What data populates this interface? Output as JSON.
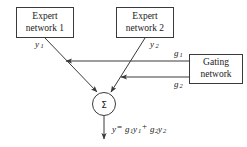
{
  "diagram": {
    "background_color": "#ffffff",
    "stroke_color": "#3a3a3a",
    "text_color": "#1a1a1a",
    "nodes": {
      "expert1": {
        "line1": "Expert",
        "line2": "network 1",
        "output_label": "y",
        "output_sub": "1"
      },
      "expert2": {
        "line1": "Expert",
        "line2": "network 2",
        "output_label": "y",
        "output_sub": "2"
      },
      "gating": {
        "line1": "Gating",
        "line2": "network",
        "output1_label": "g",
        "output1_sub": "1",
        "output2_label": "g",
        "output2_sub": "2"
      },
      "summation": {
        "symbol": "Σ"
      }
    },
    "output": {
      "var": "y",
      "equals": "=",
      "term1_coef": "g",
      "term1_coef_sub": "1",
      "term1_var": "y",
      "term1_var_sub": "1",
      "plus": "+",
      "term2_coef": "g",
      "term2_coef_sub": "2",
      "term2_var": "y",
      "term2_var_sub": "2"
    }
  }
}
